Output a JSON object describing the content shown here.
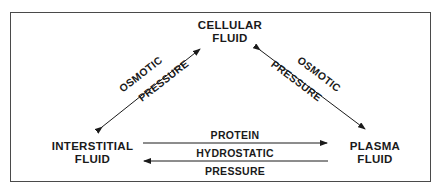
{
  "diagram": {
    "nodes": {
      "cellular": {
        "line1": "CELLULAR",
        "line2": "FLUID"
      },
      "interstitial": {
        "line1": "INTERSTITIAL",
        "line2": "FLUID"
      },
      "plasma": {
        "line1": "PLASMA",
        "line2": "FLUID"
      }
    },
    "edges": {
      "interstitial_cellular": {
        "line1": "OSMOTIC",
        "line2": "PRESSURE",
        "direction": "bidirectional"
      },
      "cellular_plasma": {
        "line1": "OSMOTIC",
        "line2": "PRESSURE",
        "direction": "bidirectional"
      },
      "interstitial_to_plasma": {
        "label": "PROTEIN",
        "direction": "interstitial-to-plasma"
      },
      "plasma_to_interstitial": {
        "line1": "HYDROSTATIC",
        "line2": "PRESSURE",
        "direction": "plasma-to-interstitial"
      }
    },
    "colors": {
      "line": "#1a1a1a",
      "frame": "#4a4a4a",
      "background": "#ffffff"
    }
  }
}
